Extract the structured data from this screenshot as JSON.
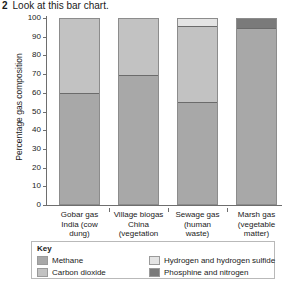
{
  "question": {
    "number": "2",
    "text": "Look at this bar chart."
  },
  "colors": {
    "methane": "#a8a8a8",
    "carbon_dioxide": "#c2c2c2",
    "hydrogen_and_hydrogen_sulfide": "#e4e4e4",
    "phosphine_and_nitrogen": "#7a7a7a",
    "axis": "#6e6e6e",
    "bar_border": "#8c8c8c",
    "key_border": "#b9b9b9"
  },
  "key": {
    "title": "Key",
    "items": [
      {
        "label": "Methane",
        "color_key": "methane"
      },
      {
        "label": "Hydrogen and hydrogen sulfide",
        "color_key": "hydrogen_and_hydrogen_sulfide"
      },
      {
        "label": "Carbon dioxide",
        "color_key": "carbon_dioxide"
      },
      {
        "label": "Phosphine and nitrogen",
        "color_key": "phosphine_and_nitrogen"
      }
    ]
  },
  "chart_data": {
    "type": "bar",
    "subtype": "stacked",
    "title": "",
    "xlabel": "",
    "ylabel": "Percentage gas composition",
    "ylim": [
      0,
      100
    ],
    "yticks": [
      0,
      10,
      20,
      30,
      40,
      50,
      60,
      70,
      80,
      90,
      100
    ],
    "grid": false,
    "legend_position": "bottom",
    "categories": [
      "Gobar gas India (cow dung)",
      "Village biogas China (vegetation and cow dung)",
      "Sewage gas (human waste)",
      "Marsh gas (vegetable matter)"
    ],
    "category_lines": [
      [
        "Gobar gas",
        "India (cow",
        "dung)"
      ],
      [
        "Village biogas",
        "China (vegetation",
        "and cow dung)"
      ],
      [
        "Sewage gas",
        "(human",
        "waste)"
      ],
      [
        "Marsh gas",
        "(vegetable",
        "matter)"
      ]
    ],
    "series": [
      {
        "name": "Methane",
        "values": [
          60,
          70,
          55,
          95
        ]
      },
      {
        "name": "Carbon dioxide",
        "values": [
          40,
          30,
          41,
          0
        ]
      },
      {
        "name": "Hydrogen and hydrogen sulfide",
        "values": [
          0,
          0,
          4,
          0
        ]
      },
      {
        "name": "Phosphine and nitrogen",
        "values": [
          0,
          0,
          0,
          5
        ]
      }
    ],
    "stacks": [
      [
        {
          "series": "Methane",
          "from": 0,
          "to": 60
        },
        {
          "series": "Carbon dioxide",
          "from": 60,
          "to": 100
        }
      ],
      [
        {
          "series": "Methane",
          "from": 0,
          "to": 70
        },
        {
          "series": "Carbon dioxide",
          "from": 70,
          "to": 100
        }
      ],
      [
        {
          "series": "Methane",
          "from": 0,
          "to": 55
        },
        {
          "series": "Carbon dioxide",
          "from": 55,
          "to": 96
        },
        {
          "series": "Hydrogen and hydrogen sulfide",
          "from": 96,
          "to": 100
        }
      ],
      [
        {
          "series": "Methane",
          "from": 0,
          "to": 95
        },
        {
          "series": "Phosphine and nitrogen",
          "from": 95,
          "to": 100
        }
      ]
    ]
  }
}
